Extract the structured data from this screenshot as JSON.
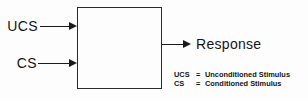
{
  "diagram": {
    "background_color": "#fdfdfd",
    "line_color": "#1a1a1a",
    "text_color": "#151515",
    "inputs": [
      {
        "label": "UCS",
        "arrow": "arrow-right"
      },
      {
        "label": "CS",
        "arrow": "arrow-right"
      }
    ],
    "process_box": {
      "label": "",
      "border_color": "#2a2a2a"
    },
    "output": {
      "label": "Response",
      "arrow": "arrow-right"
    },
    "legend": [
      {
        "abbr": "UCS",
        "equals": "=",
        "term": "Unconditioned Stimulus"
      },
      {
        "abbr": "CS",
        "equals": "=",
        "term": "Conditioned Stimulus"
      }
    ]
  }
}
